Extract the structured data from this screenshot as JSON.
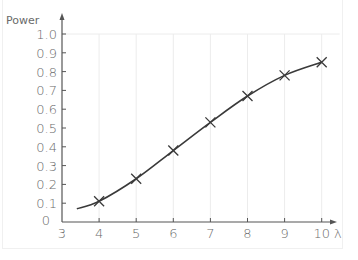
{
  "chart_data": {
    "type": "line",
    "title": "",
    "xlabel": "λ",
    "ylabel": "Power",
    "xlim": [
      3,
      10
    ],
    "ylim": [
      0,
      1.0
    ],
    "x_ticks": [
      "3",
      "4",
      "5",
      "6",
      "7",
      "8",
      "9",
      "10"
    ],
    "y_ticks": [
      "0",
      "0.1",
      "0.2",
      "0.3",
      "0.4",
      "0.5",
      "0.6",
      "0.7",
      "0.8",
      "0.9",
      "1.0"
    ],
    "grid": {
      "vertical": true,
      "horizontal": false
    },
    "legend": null,
    "series": [
      {
        "name": "Power",
        "marker": "x",
        "x": [
          4,
          5,
          6,
          7,
          8,
          9,
          10
        ],
        "values": [
          0.11,
          0.23,
          0.38,
          0.53,
          0.67,
          0.78,
          0.85
        ]
      }
    ],
    "curve": {
      "description": "smooth fitted curve through the points",
      "x": [
        3.4,
        4,
        5,
        6,
        7,
        8,
        9,
        10
      ],
      "values": [
        0.07,
        0.11,
        0.23,
        0.38,
        0.53,
        0.67,
        0.78,
        0.85
      ]
    },
    "colors": {
      "line": "#3a3a3a",
      "axis": "#555555",
      "grid": "#ececec",
      "text": "#6a6a6a"
    }
  }
}
